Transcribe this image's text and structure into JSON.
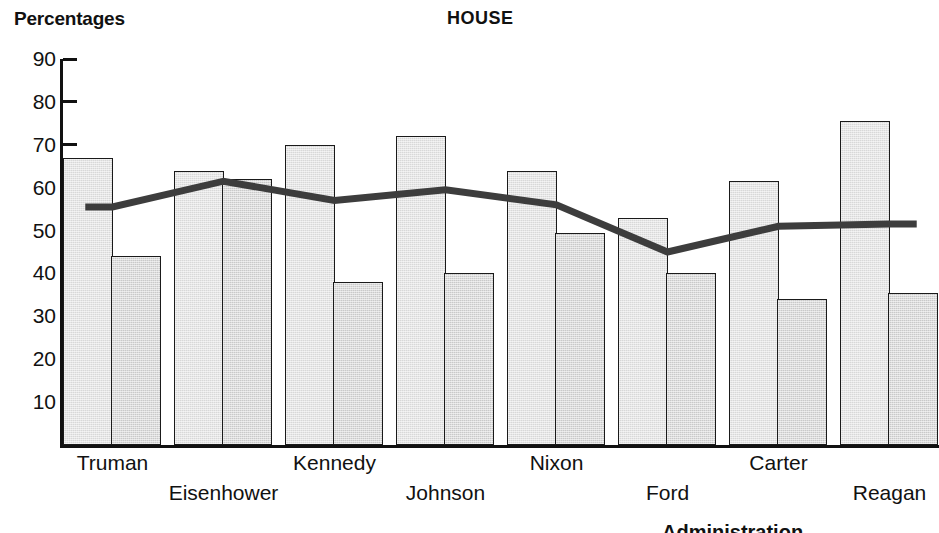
{
  "header": {
    "y_axis_title": "Percentages",
    "chart_title": "HOUSE"
  },
  "footnote": "Administration",
  "chart_data": {
    "type": "bar",
    "title": "HOUSE",
    "ylabel": "Percentages",
    "xlabel": "Administration",
    "ylim": [
      0,
      90
    ],
    "yticks": [
      10,
      20,
      30,
      40,
      50,
      60,
      70,
      80,
      90
    ],
    "ytick_labels": [
      "10",
      "20",
      "30",
      "40",
      "50",
      "60",
      "70",
      "80",
      "90"
    ],
    "grid": false,
    "legend": "none",
    "categories": [
      "Truman",
      "Eisenhower",
      "Kennedy",
      "Johnson",
      "Nixon",
      "Ford",
      "Carter",
      "Reagan"
    ],
    "series": [
      {
        "name": "bar-1",
        "values": [
          67,
          64,
          70,
          72,
          64,
          53,
          61.5,
          75.5
        ]
      },
      {
        "name": "bar-2",
        "values": [
          44,
          62,
          38,
          40,
          49.5,
          40,
          34,
          35.5
        ]
      },
      {
        "name": "trend-line",
        "type": "line",
        "values": [
          55.5,
          61.5,
          57,
          59.5,
          56,
          45,
          51,
          51.5
        ]
      }
    ],
    "line_color": "#3d3d3d",
    "bar_fill_1": "#d8d8d8",
    "bar_fill_2": "#c9c9c9",
    "bar_edge": "#1a1a1a"
  },
  "xlabels": [
    {
      "text": "Truman",
      "row": 0
    },
    {
      "text": "Eisenhower",
      "row": 1
    },
    {
      "text": "Kennedy",
      "row": 0
    },
    {
      "text": "Johnson",
      "row": 1
    },
    {
      "text": "Nixon",
      "row": 0
    },
    {
      "text": "Ford",
      "row": 1
    },
    {
      "text": "Carter",
      "row": 0
    },
    {
      "text": "Reagan",
      "row": 1
    }
  ]
}
